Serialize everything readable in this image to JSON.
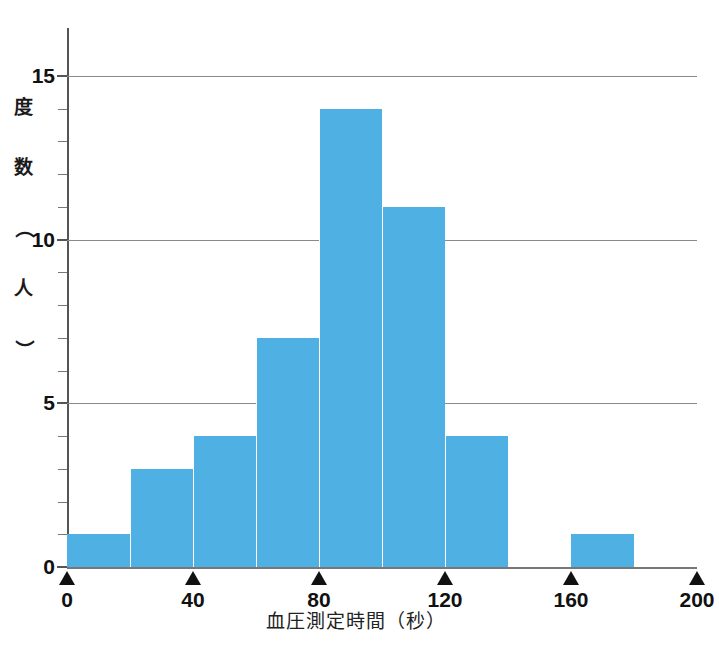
{
  "chart_data": {
    "type": "bar",
    "title": "",
    "subtitle": "",
    "xlabel": "血圧測定時間（秒）",
    "ylabel": "度数（人）",
    "ylabel_chars": [
      "度",
      "数",
      "（",
      "人",
      "）"
    ],
    "xlim": [
      0,
      200
    ],
    "ylim": [
      0,
      15.6
    ],
    "bin_width": 20,
    "grid": "horizontal-major-only",
    "legend": "none",
    "bar_color": "#4fb0e4",
    "bin_edges": [
      0,
      20,
      40,
      60,
      80,
      100,
      120,
      140,
      160,
      180,
      200
    ],
    "categories": [
      "0-20",
      "20-40",
      "40-60",
      "60-80",
      "80-100",
      "100-120",
      "120-140",
      "140-160",
      "160-180",
      "180-200"
    ],
    "values": [
      1,
      3,
      4,
      7,
      14,
      11,
      4,
      0,
      1,
      0
    ],
    "x_ticks": [
      {
        "value": 0,
        "label": "0"
      },
      {
        "value": 40,
        "label": "40"
      },
      {
        "value": 80,
        "label": "80"
      },
      {
        "value": 120,
        "label": "120"
      },
      {
        "value": 160,
        "label": "160"
      },
      {
        "value": 200,
        "label": "200"
      }
    ],
    "y_ticks_major": [
      {
        "value": 0,
        "label": "0"
      },
      {
        "value": 5,
        "label": "5"
      },
      {
        "value": 10,
        "label": "10"
      },
      {
        "value": 15,
        "label": "15"
      }
    ],
    "y_ticks_minor": [
      1,
      2,
      3,
      4,
      6,
      7,
      8,
      9,
      11,
      12,
      13,
      14
    ],
    "gridline_values": [
      5,
      10,
      15
    ],
    "gridline_color": "#8a8a8a",
    "axis_color": "#555555",
    "background_color": "#ffffff"
  }
}
